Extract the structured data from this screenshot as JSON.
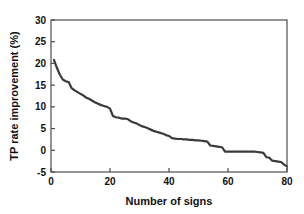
{
  "chart_data": {
    "type": "line",
    "title": "",
    "xlabel": "Number of signs",
    "ylabel": "TP rate improvement (%)",
    "xlim": [
      0,
      80
    ],
    "ylim": [
      -5,
      30
    ],
    "xticks": [
      0,
      20,
      40,
      60,
      80
    ],
    "yticks": [
      -5,
      0,
      5,
      10,
      15,
      20,
      25,
      30
    ],
    "xtick_labels": [
      "0",
      "20",
      "40",
      "60",
      "80"
    ],
    "ytick_labels": [
      "-5",
      "0",
      "5",
      "10",
      "15",
      "20",
      "25",
      "30"
    ],
    "grid": false,
    "legend": null,
    "line_color": "#3a3a3a",
    "line_width": 2.2,
    "series": [
      {
        "name": "TP rate improvement",
        "x": [
          1,
          2,
          3,
          4,
          5,
          6,
          7,
          8,
          9,
          10,
          11,
          12,
          13,
          14,
          15,
          16,
          17,
          18,
          19,
          20,
          21,
          22,
          23,
          24,
          25,
          26,
          27,
          28,
          29,
          30,
          31,
          32,
          33,
          34,
          35,
          36,
          37,
          38,
          39,
          40,
          41,
          42,
          43,
          44,
          45,
          46,
          47,
          48,
          49,
          50,
          51,
          52,
          53,
          54,
          55,
          56,
          57,
          58,
          59,
          60,
          61,
          62,
          63,
          64,
          65,
          66,
          67,
          68,
          69,
          70,
          71,
          72,
          73,
          74,
          75,
          76,
          77,
          78,
          79,
          80
        ],
        "y": [
          20.8,
          19.0,
          17.4,
          16.3,
          15.9,
          15.7,
          14.3,
          13.8,
          13.4,
          13.0,
          12.6,
          12.1,
          11.8,
          11.4,
          11.0,
          10.7,
          10.4,
          10.2,
          10.0,
          9.6,
          7.9,
          7.6,
          7.5,
          7.3,
          7.3,
          7.2,
          6.7,
          6.4,
          6.2,
          5.8,
          5.5,
          5.3,
          5.0,
          4.7,
          4.4,
          4.2,
          4.0,
          3.8,
          3.5,
          3.3,
          2.8,
          2.7,
          2.6,
          2.6,
          2.5,
          2.5,
          2.4,
          2.4,
          2.3,
          2.3,
          2.2,
          2.1,
          2.0,
          1.1,
          1.0,
          0.9,
          0.8,
          0.7,
          -0.3,
          -0.3,
          -0.3,
          -0.3,
          -0.3,
          -0.3,
          -0.3,
          -0.3,
          -0.3,
          -0.3,
          -0.3,
          -0.4,
          -0.5,
          -0.6,
          -1.6,
          -1.7,
          -2.4,
          -2.5,
          -2.6,
          -2.7,
          -3.3,
          -3.7
        ]
      }
    ]
  },
  "axes": {
    "frame_color": "#4d4d4d",
    "background": "#ffffff"
  }
}
